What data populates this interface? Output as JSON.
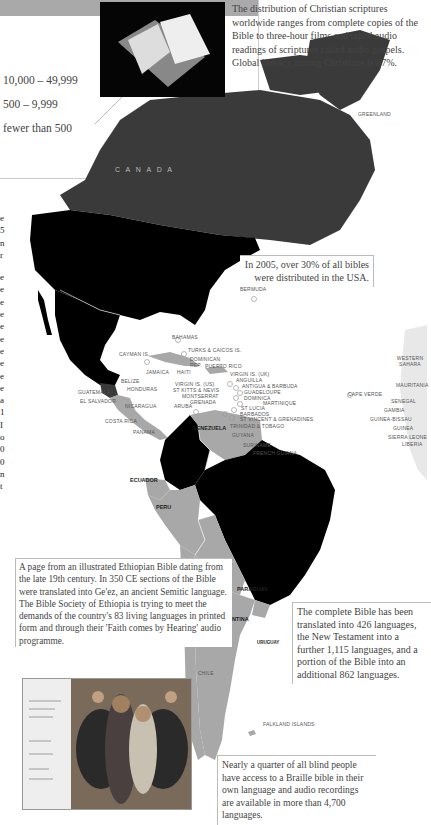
{
  "legend": {
    "items": [
      {
        "label": "10,000 – 49,999"
      },
      {
        "label": "500 – 9,999"
      },
      {
        "label": "fewer than 500"
      }
    ]
  },
  "intro": {
    "text": "The distribution of Christian scriptures worldwide ranges from complete copies of the Bible to three-hour films and taped audio readings of scriptures called audio gospels. Global literacy among Christians is 87%."
  },
  "callouts": {
    "usa": "In 2005, over 30% of all bibles were distributed in the USA.",
    "ethiopia": "A page from an illustrated Ethiopian Bible dating from the late 19th century. In 350 CE sections of the Bible were translated into Ge'ez, an ancient Semitic language. The Bible Society of Ethiopia is trying to meet the demands of the country's 83 living languages in printed form and through their 'Faith comes by Hearing' audio programme.",
    "translations": "The complete Bible has been translated into 426 languages, the New Testament into a further 1,115 languages, and a portion of the Bible into an additional 862 languages.",
    "braille": "Nearly a quarter of all blind people have access to a Braille bible in their own language and audio recordings are available in more than 4,700 languages."
  },
  "map": {
    "colors": {
      "dark": "#000000",
      "mid": "#3a3a3a",
      "light": "#a8a8a8",
      "ocean": "#ffffff"
    },
    "labels": {
      "canada": "C A N A D A",
      "greenland": "GREENLAND",
      "usa": "USA",
      "bermuda": "BERMUDA",
      "bahamas": "BAHAMAS",
      "turks": "TURKS & CAICOS IS.",
      "cayman": "CAYMAN IS.",
      "cuba": "CUBA",
      "dominican": "DOMINICAN REP.",
      "puerto_rico": "PUERTO RICO",
      "jamaica": "JAMAICA",
      "haiti": "HAITI",
      "virgin_uk": "VIRGIN IS. (UK)",
      "anguilla": "ANGUILLA",
      "virgin_us": "VIRGIN IS. (US)",
      "antigua": "ANTIGUA & BARBUDA",
      "st_kitts": "ST KITTS & NEVIS",
      "guadeloupe": "GUADELOUPE",
      "montserrat": "MONTSERRAT",
      "dominica": "DOMINICA",
      "grenada": "GRENADA",
      "martinique": "MARTINIQUE",
      "st_lucia": "ST LUCIA",
      "barbados": "BARBADOS",
      "st_vincent": "ST VINCENT & GRENADINES",
      "trinidad": "TRINIDAD & TOBAGO",
      "belize": "BELIZE",
      "guatemala": "GUATEMALA",
      "honduras": "HONDURAS",
      "el_salvador": "EL SALVADOR",
      "nicaragua": "NICARAGUA",
      "costa_rica": "COSTA RICA",
      "panama": "PANAMA",
      "aruba": "ARUBA",
      "venezuela": "VENEZUELA",
      "guyana": "GUYANA",
      "suriname": "SURINAME",
      "french_guiana": "FRENCH GUIANA",
      "ecuador": "ECUADOR",
      "peru": "PERU",
      "bolivia": "BOLIVIA",
      "paraguay": "PARAGUAY",
      "argentina": "ARGENTINA",
      "uruguay": "URUGUAY",
      "chile": "CHILE",
      "falklands": "FALKLAND ISLANDS",
      "cape_verde": "CAPE VERDE",
      "western_sahara": "WESTERN SAHARA",
      "mauritania": "MAURITANIA",
      "senegal": "SENEGAL",
      "gambia": "GAMBIA",
      "guinea_bissau": "GUINEA-BISSAU",
      "guinea": "GUINEA",
      "sierra_leone": "SIERRA LEONE",
      "liberia": "LIBERIA"
    }
  },
  "left_column_glyphs": [
    "e",
    "5",
    "n",
    "r",
    "e",
    "e",
    "e",
    "e",
    "e",
    "e",
    "e",
    "e",
    "e",
    "e",
    "a",
    "1",
    "I",
    "o",
    "0",
    "0",
    "n",
    "t",
    "s",
    "a",
    "l",
    "t",
    "a",
    "a",
    "t",
    "s",
    "."
  ]
}
